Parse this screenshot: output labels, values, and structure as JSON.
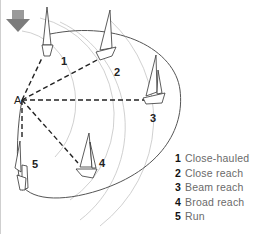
{
  "diagram": {
    "wind_icon": "wind-arrow-down-icon",
    "origin_label": "A",
    "colors": {
      "arrow": "#8a8a8a",
      "lines": "#222222",
      "arcs": "#bdbdbd"
    },
    "boats": [
      {
        "number": "1",
        "point": "Close-hauled"
      },
      {
        "number": "2",
        "point": "Close reach"
      },
      {
        "number": "3",
        "point": "Beam reach"
      },
      {
        "number": "4",
        "point": "Broad reach"
      },
      {
        "number": "5",
        "point": "Run"
      }
    ]
  },
  "legend": {
    "items": [
      {
        "num": "1",
        "label": "Close-hauled"
      },
      {
        "num": "2",
        "label": "Close reach"
      },
      {
        "num": "3",
        "label": "Beam reach"
      },
      {
        "num": "4",
        "label": "Broad reach"
      },
      {
        "num": "5",
        "label": "Run"
      }
    ]
  }
}
